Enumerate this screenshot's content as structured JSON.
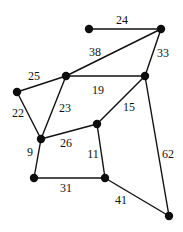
{
  "graph": {
    "type": "weighted-undirected-graph",
    "nodes": [
      {
        "id": "n1",
        "x": 89,
        "y": 29
      },
      {
        "id": "n2",
        "x": 161,
        "y": 29
      },
      {
        "id": "n3",
        "x": 66,
        "y": 76
      },
      {
        "id": "n4",
        "x": 17,
        "y": 92
      },
      {
        "id": "n5",
        "x": 145,
        "y": 76
      },
      {
        "id": "n6",
        "x": 41,
        "y": 139
      },
      {
        "id": "n7",
        "x": 97,
        "y": 124
      },
      {
        "id": "n8",
        "x": 34,
        "y": 178
      },
      {
        "id": "n9",
        "x": 105,
        "y": 178
      },
      {
        "id": "n10",
        "x": 169,
        "y": 216
      }
    ],
    "edges": [
      {
        "from": "n1",
        "to": "n2",
        "weight": "24",
        "lx": 122,
        "ly": 24
      },
      {
        "from": "n3",
        "to": "n2",
        "weight": "38",
        "lx": 95,
        "ly": 56
      },
      {
        "from": "n2",
        "to": "n5",
        "weight": "33",
        "lx": 163,
        "ly": 57
      },
      {
        "from": "n4",
        "to": "n3",
        "weight": "25",
        "lx": 34,
        "ly": 80
      },
      {
        "from": "n3",
        "to": "n5",
        "weight": "19",
        "lx": 98,
        "ly": 94
      },
      {
        "from": "n4",
        "to": "n6",
        "weight": "22",
        "lx": 18,
        "ly": 117
      },
      {
        "from": "n3",
        "to": "n6",
        "weight": "23",
        "lx": 65,
        "ly": 112
      },
      {
        "from": "n5",
        "to": "n7",
        "weight": "15",
        "lx": 129,
        "ly": 111
      },
      {
        "from": "n6",
        "to": "n7",
        "weight": "26",
        "lx": 66,
        "ly": 147
      },
      {
        "from": "n6",
        "to": "n8",
        "weight": "9",
        "lx": 30,
        "ly": 156
      },
      {
        "from": "n7",
        "to": "n9",
        "weight": "11",
        "lx": 93,
        "ly": 158
      },
      {
        "from": "n8",
        "to": "n9",
        "weight": "31",
        "lx": 66,
        "ly": 192
      },
      {
        "from": "n9",
        "to": "n10",
        "weight": "41",
        "lx": 121,
        "ly": 204
      },
      {
        "from": "n5",
        "to": "n10",
        "weight": "62",
        "lx": 168,
        "ly": 158
      }
    ]
  }
}
